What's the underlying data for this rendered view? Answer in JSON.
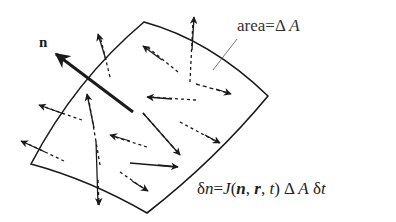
{
  "diagram": {
    "normal_label": "n",
    "area_label": {
      "prefix": "area=",
      "delta": "Δ",
      "var": "A"
    },
    "equation": {
      "lhs_delta": "δ",
      "lhs_var": "n",
      "equals": "=",
      "func": "J",
      "open": "(",
      "arg1": "n",
      "comma1": ", ",
      "arg2": "r",
      "comma2": ", ",
      "arg3": "t",
      "close": ")",
      "delta_a": " Δ ",
      "area_var": "A",
      "delta_t": " δ",
      "time_var": "t"
    },
    "colors": {
      "stroke": "#1a1a1a",
      "background": "#ffffff"
    }
  }
}
